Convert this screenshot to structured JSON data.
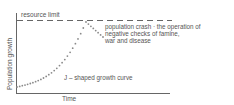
{
  "diagram": {
    "y_axis_label": "Population growth",
    "x_axis_label": "Time",
    "resource_limit_label": "resource limit",
    "crash_label_lines": [
      "population crash  · the operation of",
      "negative checks of famine,",
      "war and disease"
    ],
    "curve_label": "J – shaped growth curve",
    "colors": {
      "axis": "#666666",
      "curve": "#8a8a8a",
      "text": "#555555"
    }
  }
}
